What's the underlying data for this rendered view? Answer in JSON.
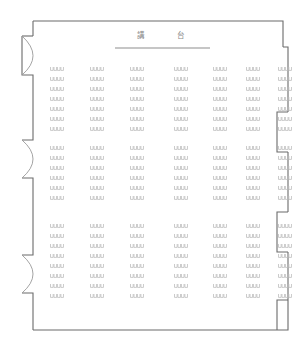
{
  "diagram": {
    "kind": "lecture-hall-seating-plan",
    "stage": {
      "label_chars": [
        "講",
        "台"
      ],
      "label_full": "講 台",
      "char_left": "講",
      "char_right": "台",
      "edge_line": {
        "x1": 115,
        "x2": 210,
        "y": 48
      }
    },
    "room": {
      "outline_color": "#6b6b6b",
      "seat_color": "#b9b9b9",
      "door_arc_color": "#9a9a9a",
      "background": "#ffffff",
      "bounds": {
        "left": 22,
        "top": 21,
        "right": 288,
        "bottom": 335
      }
    },
    "left_wall": {
      "feature": "door-swing-arc",
      "count": 3,
      "doors": [
        {
          "index": 1,
          "y_top": 36,
          "y_bottom": 75
        },
        {
          "index": 2,
          "y_top": 140,
          "y_bottom": 178
        },
        {
          "index": 3,
          "y_top": 255,
          "y_bottom": 293
        }
      ]
    },
    "right_wall": {
      "feature": "rectangular-alcove",
      "count": 3,
      "alcoves": [
        {
          "index": 1,
          "y_top": 112,
          "y_bottom": 152
        },
        {
          "index": 2,
          "y_top": 212,
          "y_bottom": 252
        },
        {
          "index": 3,
          "y_top": 300,
          "y_bottom": 330
        }
      ]
    },
    "seating": {
      "seat_glyph": "U",
      "seats_per_block": 4,
      "blocks_per_row": 7,
      "block_columns_x": [
        57,
        97,
        137,
        181,
        220,
        253,
        285
      ],
      "row_groups": [
        {
          "name": "front",
          "rows": 7,
          "y_start": 67,
          "row_pitch": 10
        },
        {
          "name": "middle",
          "rows": 6,
          "y_start": 146,
          "row_pitch": 10
        },
        {
          "name": "rear",
          "rows": 8,
          "y_start": 224,
          "row_pitch": 10
        }
      ],
      "total_rows": 21,
      "total_blocks": 147,
      "total_seats": 588,
      "center_aisle_after_block": 3,
      "horizontal_aisles": 2
    }
  }
}
